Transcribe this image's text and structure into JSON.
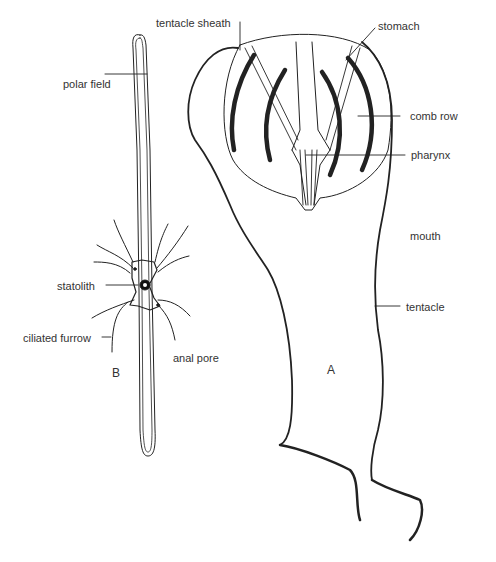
{
  "figure": {
    "specimens": [
      {
        "id": "A",
        "label": "A"
      },
      {
        "id": "B",
        "label": "B"
      }
    ],
    "labels_A": {
      "tentacle_sheath": "tentacle sheath",
      "stomach": "stomach",
      "comb_row": "comb row",
      "pharynx": "pharynx",
      "mouth": "mouth",
      "tentacle": "tentacle"
    },
    "labels_B": {
      "polar_field": "polar field",
      "statolith": "statolith",
      "ciliated_furrow": "ciliated furrow",
      "anal_pore": "anal pore"
    },
    "colors": {
      "ink": "#222222",
      "background": "#ffffff"
    }
  }
}
